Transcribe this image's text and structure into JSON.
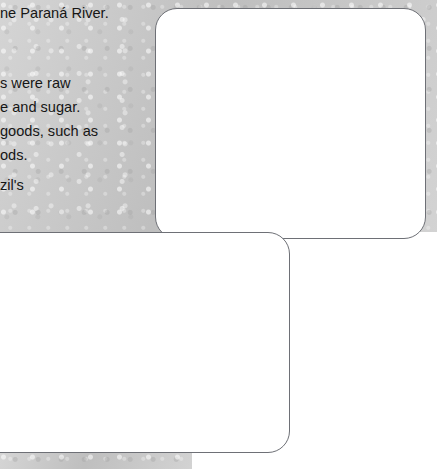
{
  "background": {
    "article_lines": [
      {
        "text": "ne Paraná River.",
        "top": 6
      },
      {
        "text": "s were raw",
        "top": 76
      },
      {
        "text": "e and sugar.",
        "top": 100
      },
      {
        "text": "goods, such as",
        "top": 124
      },
      {
        "text": "ods.",
        "top": 148
      },
      {
        "text": "zil's",
        "top": 178
      }
    ],
    "paper_color": "#c9c9c9"
  },
  "cards": {
    "export": {
      "caption_lines": [
        "Brazil:",
        "major export",
        "partners"
      ]
    },
    "import": {
      "caption_lines": [
        "Brazil:",
        "major import",
        "partners"
      ]
    }
  },
  "chart_data": [
    {
      "type": "pie",
      "name": "export",
      "title": "Brazil: major export partners",
      "unit": "%",
      "start_angle_deg": 0,
      "direction": "clockwise",
      "labels": [
        "Other",
        "USA",
        "China",
        "Argentina",
        "Germany",
        "Netherlands"
      ],
      "values": [
        59.6,
        14.2,
        9.2,
        8.3,
        4.4,
        4.3
      ],
      "value_text": [
        "59.6%",
        "14.2%",
        "9.2%",
        "8.3%",
        "4.4%",
        "4.3%"
      ],
      "colors": [
        "#d2d2d2",
        "#7e7e7e",
        "#eaeaea",
        "#a5a5a5",
        "#8c8c8c",
        "#4a4a4a"
      ],
      "slice_labels": [
        {
          "l1": "Other:",
          "l2": "59.6%",
          "left": 355,
          "top": 150,
          "align": "left"
        },
        {
          "l1": "USA:",
          "l2": "14.2%",
          "left": 282,
          "top": 177,
          "align": "center"
        },
        {
          "l1": "China:",
          "l2": "9.2%",
          "left": 240,
          "top": 113,
          "align": "left"
        },
        {
          "l1": "Argentina:",
          "l2": "8.3%",
          "left": 256,
          "top": 86,
          "align": "center"
        },
        {
          "l1": "Germany:",
          "l2": "4.4%",
          "left": 243,
          "top": 38,
          "align": "center"
        },
        {
          "l1": "Netherlands:",
          "l2": "4.3%",
          "left": 288,
          "top": 24,
          "align": "center"
        }
      ]
    },
    {
      "type": "pie",
      "name": "import",
      "title": "Brazil: major import partners",
      "unit": "%",
      "start_angle_deg": 0,
      "direction": "clockwise",
      "labels": [
        "Other",
        "USA",
        "China",
        "Argentina",
        "Germany"
      ],
      "values": [
        55.4,
        20.0,
        8.9,
        8.1,
        7.6
      ],
      "value_text": [
        "55.4%",
        "20%",
        "8.9%",
        "8.1%",
        "7.6%"
      ],
      "colors": [
        "#cfcfcf",
        "#dedede",
        "#a8a8a8",
        "#c2c2c2",
        "#474747"
      ],
      "slice_labels": [
        {
          "l1": "Other: 55.4%",
          "l2": "",
          "left": 168,
          "top": 341,
          "align": "left"
        },
        {
          "l1": "USA: 20%",
          "l2": "",
          "left": 106,
          "top": 372,
          "align": "left"
        },
        {
          "l1": "China:",
          "l2": "8.9%",
          "left": 94,
          "top": 322,
          "align": "center"
        },
        {
          "l1": "Argentina:",
          "l2": "8.1%",
          "left": 88,
          "top": 277,
          "align": "center"
        },
        {
          "l1": "Germany:",
          "l2": "7.6%",
          "left": 130,
          "top": 251,
          "align": "center"
        }
      ]
    }
  ]
}
